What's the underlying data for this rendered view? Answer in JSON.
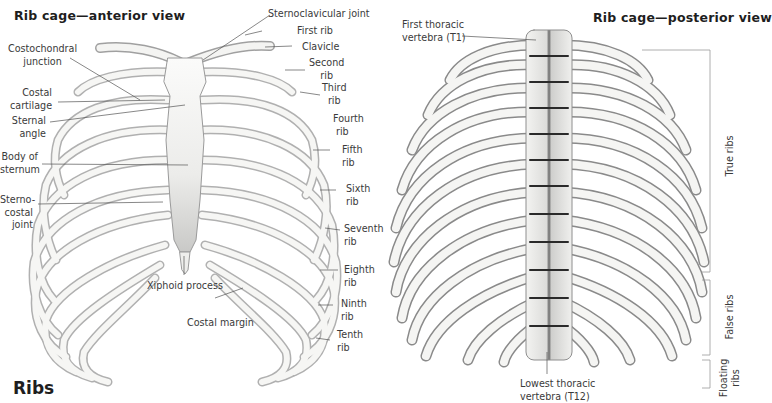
{
  "figure": {
    "title": "Ribs",
    "background": "#ffffff",
    "bone_fill": "#f4f4f2",
    "bone_stroke": "#9a9a9a",
    "shadow": "#6e6e6e",
    "leader_color": "#555555"
  },
  "anterior": {
    "title": "Rib cage—anterior view",
    "labels": {
      "costochondral_junction": [
        "Costochondral",
        "junction"
      ],
      "costal_cartilage": [
        "Costal",
        "cartilage"
      ],
      "sternal_angle": [
        "Sternal",
        "angle"
      ],
      "body_of_sternum": [
        "Body of",
        "sternum"
      ],
      "sternocostal_joint": [
        "Sterno-",
        "costal",
        "joint"
      ],
      "sternoclavicular_joint": "Sternoclavicular joint",
      "first_rib": "First rib",
      "clavicle": "Clavicle",
      "second_rib": [
        "Second",
        "rib"
      ],
      "third_rib": [
        "Third",
        "rib"
      ],
      "fourth_rib": [
        "Fourth",
        "rib"
      ],
      "fifth_rib": [
        "Fifth",
        "rib"
      ],
      "sixth_rib": [
        "Sixth",
        "rib"
      ],
      "seventh_rib": [
        "Seventh",
        "rib"
      ],
      "eighth_rib": [
        "Eighth",
        "rib"
      ],
      "ninth_rib": [
        "Ninth",
        "rib"
      ],
      "tenth_rib": [
        "Tenth",
        "rib"
      ],
      "xiphoid_process": "Xiphoid process",
      "costal_margin": "Costal margin"
    }
  },
  "posterior": {
    "title": "Rib cage—posterior view",
    "labels": {
      "first_thoracic_vertebra": [
        "First thoracic",
        "vertebra (T1)"
      ],
      "lowest_thoracic_vertebra": [
        "Lowest thoracic",
        "vertebra (T12)"
      ]
    },
    "brackets": {
      "true_ribs": "True ribs",
      "false_ribs": "False ribs",
      "floating_ribs": [
        "Floating",
        "ribs"
      ]
    }
  }
}
